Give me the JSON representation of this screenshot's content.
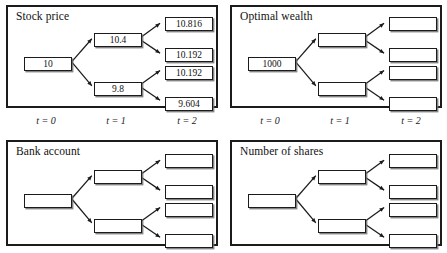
{
  "figure": {
    "width": 447,
    "height": 253,
    "background": "#ffffff",
    "ink_color": "#1b1b1b",
    "shadow_color": "#6e6e6e"
  },
  "time_axis": {
    "labels": [
      "t = 0",
      "t = 1",
      "t = 2"
    ]
  },
  "panels": [
    {
      "id": "stock-price",
      "title": "Stock price",
      "has_time_axis": true,
      "nodes": {
        "t0": [
          "10"
        ],
        "t1": [
          "10.4",
          "9.8"
        ],
        "t2": [
          "10.816",
          "10.192",
          "10.192",
          "9.604"
        ]
      }
    },
    {
      "id": "optimal-wealth",
      "title": "Optimal wealth",
      "has_time_axis": true,
      "nodes": {
        "t0": [
          "1000"
        ],
        "t1": [
          "",
          ""
        ],
        "t2": [
          "",
          "",
          "",
          ""
        ]
      }
    },
    {
      "id": "bank-account",
      "title": "Bank account",
      "has_time_axis": false,
      "nodes": {
        "t0": [
          ""
        ],
        "t1": [
          "",
          ""
        ],
        "t2": [
          "",
          "",
          "",
          ""
        ]
      }
    },
    {
      "id": "number-of-shares",
      "title": "Number of shares",
      "has_time_axis": false,
      "nodes": {
        "t0": [
          ""
        ],
        "t1": [
          "",
          ""
        ],
        "t2": [
          "",
          "",
          "",
          ""
        ]
      }
    }
  ]
}
